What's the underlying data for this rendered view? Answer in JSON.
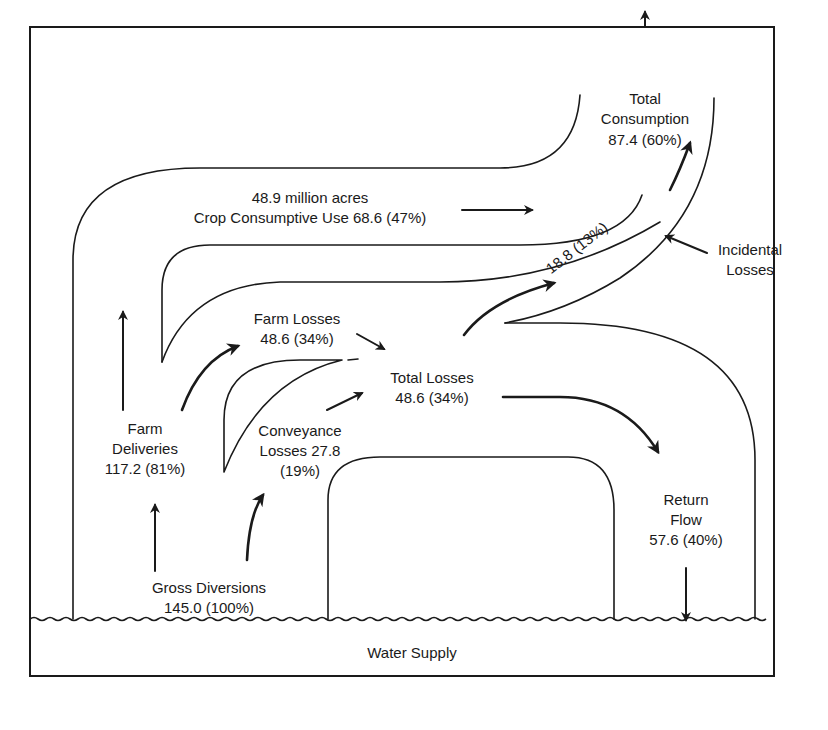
{
  "diagram": {
    "type": "flow-diagram",
    "colors": {
      "ink": "#1a1a1a",
      "background": "#ffffff"
    },
    "labels": {
      "total_consumption": {
        "line1": "Total",
        "line2": "Consumption",
        "line3": "87.4 (60%)"
      },
      "crop_use": {
        "line1": "48.9 million acres",
        "line2": "Crop Consumptive Use 68.6 (47%)"
      },
      "incidental_losses": {
        "line1": "Incidental",
        "line2": "Losses"
      },
      "incidental_value": "18.8 (13%)",
      "farm_losses": {
        "line1": "Farm Losses",
        "line2": "48.6 (34%)"
      },
      "total_losses": {
        "line1": "Total Losses",
        "line2": "48.6 (34%)"
      },
      "farm_deliveries": {
        "line1": "Farm",
        "line2": "Deliveries",
        "line3": "117.2 (81%)"
      },
      "conveyance_losses": {
        "line1": "Conveyance",
        "line2": "Losses 27.8",
        "line3": "(19%)"
      },
      "gross_diversions": {
        "line1": "Gross Diversions",
        "line2": "145.0 (100%)"
      },
      "return_flow": {
        "line1": "Return",
        "line2": "Flow",
        "line3": "57.6 (40%)"
      },
      "water_supply": "Water Supply"
    },
    "flows": [
      {
        "from": "Water Supply",
        "to": "Gross Diversions",
        "value": 145.0,
        "percent": 100
      },
      {
        "from": "Gross Diversions",
        "to": "Farm Deliveries",
        "value": 117.2,
        "percent": 81
      },
      {
        "from": "Gross Diversions",
        "to": "Conveyance Losses",
        "value": 27.8,
        "percent": 19
      },
      {
        "from": "Farm Deliveries",
        "to": "Crop Consumptive Use",
        "value": 68.6,
        "percent": 47
      },
      {
        "from": "Farm Deliveries",
        "to": "Farm Losses",
        "value": 48.6,
        "percent": 34
      },
      {
        "from": "Farm Losses + Conveyance Losses",
        "to": "Total Losses",
        "value": 48.6,
        "percent": 34
      },
      {
        "from": "Total Losses",
        "to": "Incidental Losses",
        "value": 18.8,
        "percent": 13
      },
      {
        "from": "Total Losses",
        "to": "Return Flow",
        "value": 57.6,
        "percent": 40
      },
      {
        "from": "Crop Consumptive Use + Incidental Losses",
        "to": "Total Consumption",
        "value": 87.4,
        "percent": 60
      }
    ]
  }
}
